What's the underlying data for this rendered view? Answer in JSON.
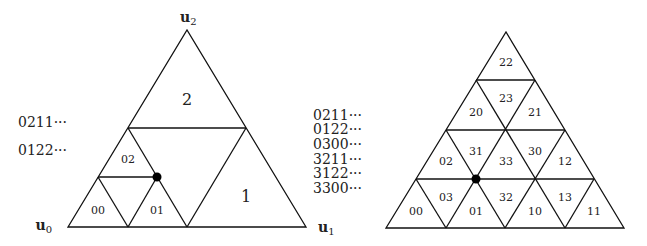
{
  "left_diagram": {
    "vertex_labels": {
      "u0": "u",
      "u0_sub": "0",
      "u1": "u",
      "u1_sub": "1",
      "u2": "u",
      "u2_sub": "2"
    },
    "region_labels": {
      "r2": "2",
      "r1": "1",
      "r02": "02",
      "r00": "00",
      "r01": "01"
    },
    "addresses": [
      "0211···",
      "0122···"
    ]
  },
  "right_diagram": {
    "addresses": [
      "0211···",
      "0122···",
      "0300···",
      "3211···",
      "3122···",
      "3300···"
    ],
    "cell_labels": {
      "c22": "22",
      "c20": "20",
      "c23": "23",
      "c21": "21",
      "c02": "02",
      "c31": "31",
      "c33": "33",
      "c30": "30",
      "c12": "12",
      "c00": "00",
      "c03": "03",
      "c01": "01",
      "c32": "32",
      "c10": "10",
      "c13": "13",
      "c11": "11"
    }
  }
}
